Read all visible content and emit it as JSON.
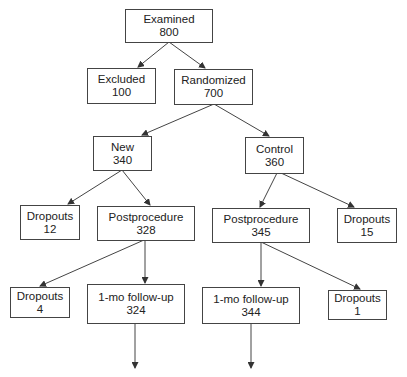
{
  "nodes": {
    "examined": {
      "label": "Examined",
      "value": "800"
    },
    "excluded": {
      "label": "Excluded",
      "value": "100"
    },
    "randomized": {
      "label": "Randomized",
      "value": "700"
    },
    "new": {
      "label": "New",
      "value": "340"
    },
    "control": {
      "label": "Control",
      "value": "360"
    },
    "new_dropouts": {
      "label": "Dropouts",
      "value": "12"
    },
    "new_post": {
      "label": "Postprocedure",
      "value": "328"
    },
    "ctrl_post": {
      "label": "Postprocedure",
      "value": "345"
    },
    "ctrl_dropouts": {
      "label": "Dropouts",
      "value": "15"
    },
    "new_post_dropouts": {
      "label": "Dropouts",
      "value": "4"
    },
    "new_followup": {
      "label": "1-mo follow-up",
      "value": "324"
    },
    "ctrl_followup": {
      "label": "1-mo follow-up",
      "value": "344"
    },
    "ctrl_post_dropouts": {
      "label": "Dropouts",
      "value": "1"
    }
  },
  "edges": [
    [
      "examined",
      "excluded"
    ],
    [
      "examined",
      "randomized"
    ],
    [
      "randomized",
      "new"
    ],
    [
      "randomized",
      "control"
    ],
    [
      "new",
      "new_dropouts"
    ],
    [
      "new",
      "new_post"
    ],
    [
      "control",
      "ctrl_post"
    ],
    [
      "control",
      "ctrl_dropouts"
    ],
    [
      "new_post",
      "new_post_dropouts"
    ],
    [
      "new_post",
      "new_followup"
    ],
    [
      "ctrl_post",
      "ctrl_followup"
    ],
    [
      "ctrl_post",
      "ctrl_post_dropouts"
    ],
    [
      "new_followup",
      "continues"
    ],
    [
      "ctrl_followup",
      "continues"
    ]
  ]
}
